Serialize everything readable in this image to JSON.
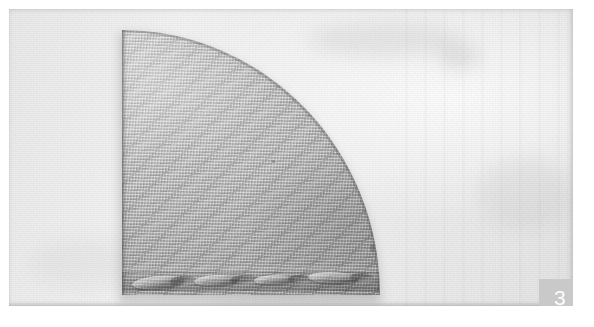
{
  "figure": {
    "number": "3",
    "badge_background": "#c9c9c9",
    "badge_text_color": "#fdfdfd"
  },
  "photo": {
    "subject": "quarter-circle knitted textile sample",
    "background_color": "#efefef",
    "fabric_color": "#b6b6b6",
    "fabric_edge_color": "#5a5a5a",
    "plate_border_color": "#ffffff"
  },
  "regions": {
    "backdrop_label": "paper backing sheet",
    "specimen_label": "knitted fabric quarter disc",
    "hem_label": "twisted cord hem along bottom edge",
    "selvedge_label": "speckled curved selvedge edge",
    "cut_edge_label": "straight cut edge at left"
  }
}
